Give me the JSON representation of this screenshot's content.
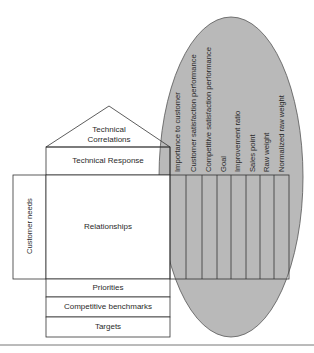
{
  "diagram": {
    "roof": {
      "label_line1": "Technical",
      "label_line2": "Correlations"
    },
    "technical_response": {
      "label": "Technical Response"
    },
    "customer_needs": {
      "label": "Customer needs"
    },
    "relationships": {
      "label": "Relationships"
    },
    "bottom_rows": [
      {
        "label": "Priorities"
      },
      {
        "label": "Competitive benchmarks"
      },
      {
        "label": "Targets"
      }
    ],
    "planning_matrix": {
      "highlight_color": "#b9b9b9",
      "columns": [
        {
          "label": "Importance to customer"
        },
        {
          "label": "Customer satisfaction performance"
        },
        {
          "label": "Competitive satisfaction performance"
        },
        {
          "label": "Goal"
        },
        {
          "label": "Improvement ratio"
        },
        {
          "label": "Sales point"
        },
        {
          "label": "Raw weight"
        },
        {
          "label": "Normalized raw weight"
        }
      ]
    }
  }
}
